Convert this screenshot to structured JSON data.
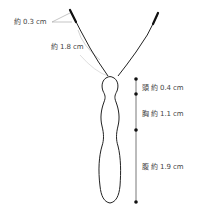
{
  "diagram": {
    "colors": {
      "outline": "#222222",
      "leader": "#9a9a9a",
      "measure_line": "#555555",
      "label_text": "#444444"
    },
    "antenna_labels": [
      {
        "id": "antenna-tip",
        "text": "約 0.3 cm"
      },
      {
        "id": "antenna-length",
        "text": "約 1.8 cm"
      }
    ],
    "segments": [
      {
        "id": "head",
        "text": "頭 約 0.4 cm"
      },
      {
        "id": "thorax",
        "text": "胸 約 1.1 cm"
      },
      {
        "id": "abdomen",
        "text": "腹 約 1.9 cm"
      }
    ]
  }
}
